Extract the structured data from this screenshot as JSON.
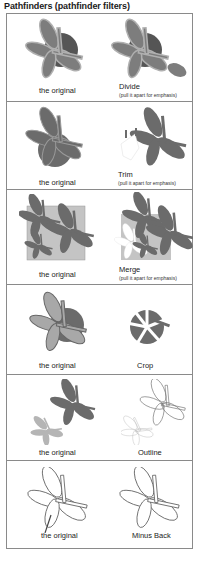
{
  "title": "Pathfinders (pathfinder filters)",
  "colors": {
    "dark_gray": "#6b6b6b",
    "mid_gray": "#8c8c8c",
    "light_gray": "#b5b5b5",
    "square_fill": "#c4c4c4",
    "outline": "#777777",
    "border": "#8a8a8a"
  },
  "panels": [
    {
      "left_label": "the original",
      "right_label": "Divide",
      "right_note": "(pull it apart for emphasis)"
    },
    {
      "left_label": "the original",
      "right_label": "Trim",
      "right_note": "(pull it apart for emphasis)"
    },
    {
      "left_label": "the original",
      "right_label": "Merge",
      "right_note": "(pull it apart for emphasis)"
    },
    {
      "left_label": "the original",
      "right_label": "Crop",
      "right_note": ""
    },
    {
      "left_label": "the original",
      "right_label": "Outline",
      "right_note": ""
    },
    {
      "left_label": "the original",
      "right_label": "Minus Back",
      "right_note": ""
    }
  ]
}
